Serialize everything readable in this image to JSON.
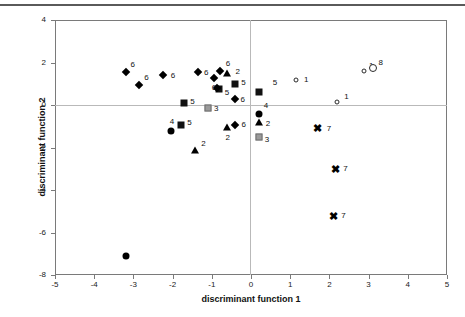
{
  "chart_data": {
    "type": "scatter",
    "title": "",
    "xlabel": "discriminant function 1",
    "ylabel": "discriminant function 2",
    "xlim": [
      -5,
      5
    ],
    "ylim": [
      -8,
      4
    ],
    "xticks": [
      "-5",
      "-4",
      "-3",
      "-2",
      "-1",
      "0",
      "1",
      "2",
      "3",
      "4",
      "5"
    ],
    "yticks": [
      "4",
      "2",
      "0",
      "-2",
      "-4",
      "-6",
      "-8"
    ],
    "xtick_values": [
      -5,
      -4,
      -3,
      -2,
      -1,
      0,
      1,
      2,
      3,
      4,
      5
    ],
    "ytick_values": [
      4,
      2,
      0,
      -2,
      -4,
      -6,
      -8
    ],
    "grid": false,
    "zero_lines": true,
    "legend": "none",
    "marker_legend": [
      {
        "group": "1",
        "marker": "open-circle-small"
      },
      {
        "group": "2",
        "marker": "filled-triangle"
      },
      {
        "group": "3",
        "marker": "gray-square"
      },
      {
        "group": "4",
        "marker": "filled-circle"
      },
      {
        "group": "5",
        "marker": "filled-square"
      },
      {
        "group": "6",
        "marker": "filled-diamond"
      },
      {
        "group": "7",
        "marker": "bold-cross"
      },
      {
        "group": "8",
        "marker": "open-circle-large"
      }
    ],
    "points": [
      {
        "x": -3.2,
        "y": 1.55,
        "label": "6",
        "marker": "filled-diamond",
        "lx": 5,
        "ly": -8
      },
      {
        "x": -2.85,
        "y": 0.95,
        "label": "6",
        "marker": "filled-diamond",
        "lx": 5,
        "ly": -8
      },
      {
        "x": -2.25,
        "y": 1.4,
        "label": "6",
        "marker": "filled-diamond",
        "lx": 8,
        "ly": 0
      },
      {
        "x": -1.35,
        "y": 1.55,
        "label": "6",
        "marker": "filled-diamond",
        "lx": 6,
        "ly": 0
      },
      {
        "x": -0.95,
        "y": 1.25,
        "label": "6",
        "marker": "filled-diamond",
        "lx": -2,
        "ly": 9
      },
      {
        "x": -0.8,
        "y": 1.6,
        "label": "6",
        "marker": "filled-diamond",
        "lx": 6,
        "ly": -8
      },
      {
        "x": -0.6,
        "y": 1.5,
        "label": "2",
        "marker": "filled-triangle",
        "lx": 8,
        "ly": -2
      },
      {
        "x": -0.82,
        "y": 0.75,
        "label": "5",
        "marker": "filled-square",
        "lx": 6,
        "ly": 3
      },
      {
        "x": -0.88,
        "y": 0.78,
        "label": "",
        "marker": "filled-diamond",
        "lx": 0,
        "ly": 0
      },
      {
        "x": -0.4,
        "y": 1.0,
        "label": "5",
        "marker": "filled-square",
        "lx": 6,
        "ly": -2
      },
      {
        "x": -0.42,
        "y": 0.3,
        "label": "6",
        "marker": "filled-diamond",
        "lx": 6,
        "ly": 0
      },
      {
        "x": -1.7,
        "y": 0.1,
        "label": "5",
        "marker": "filled-square",
        "lx": 6,
        "ly": -2
      },
      {
        "x": -1.1,
        "y": -0.15,
        "label": "3",
        "marker": "gray-square",
        "lx": 6,
        "ly": 0
      },
      {
        "x": -2.05,
        "y": -1.2,
        "label": "4",
        "marker": "filled-circle",
        "lx": -1,
        "ly": -10
      },
      {
        "x": -1.78,
        "y": -0.95,
        "label": "5",
        "marker": "filled-square",
        "lx": 6,
        "ly": -3
      },
      {
        "x": -1.42,
        "y": -2.12,
        "label": "2",
        "marker": "filled-triangle",
        "lx": 6,
        "ly": -7
      },
      {
        "x": -0.6,
        "y": -1.05,
        "label": "2",
        "marker": "filled-triangle",
        "lx": -2,
        "ly": 10
      },
      {
        "x": -0.42,
        "y": -0.95,
        "label": "6",
        "marker": "filled-diamond",
        "lx": 7,
        "ly": -1
      },
      {
        "x": 0.2,
        "y": 0.6,
        "label": "5",
        "marker": "filled-square",
        "lx": 14,
        "ly": -10
      },
      {
        "x": 0.2,
        "y": -0.4,
        "label": "4",
        "marker": "filled-circle",
        "lx": 5,
        "ly": -9
      },
      {
        "x": 0.2,
        "y": -0.8,
        "label": "2",
        "marker": "filled-triangle",
        "lx": 7,
        "ly": 1
      },
      {
        "x": 0.2,
        "y": -1.5,
        "label": "3",
        "marker": "gray-square",
        "lx": 6,
        "ly": 2
      },
      {
        "x": 1.15,
        "y": 1.2,
        "label": "1",
        "marker": "open-circle-small",
        "lx": 8,
        "ly": -1
      },
      {
        "x": 2.2,
        "y": 0.15,
        "label": "1",
        "marker": "open-circle-small",
        "lx": 7,
        "ly": -6
      },
      {
        "x": 2.88,
        "y": 1.6,
        "label": "1",
        "marker": "open-circle-small",
        "lx": 5,
        "ly": -6
      },
      {
        "x": 3.1,
        "y": 1.75,
        "label": "8",
        "marker": "open-circle-large",
        "lx": 6,
        "ly": -6
      },
      {
        "x": 1.7,
        "y": -1.1,
        "label": "7",
        "marker": "bold-cross",
        "lx": 9,
        "ly": 0
      },
      {
        "x": 2.15,
        "y": -3.0,
        "label": "7",
        "marker": "bold-cross",
        "lx": 8,
        "ly": -1
      },
      {
        "x": 2.1,
        "y": -5.2,
        "label": "7",
        "marker": "bold-cross",
        "lx": 8,
        "ly": -1
      },
      {
        "x": -3.2,
        "y": -7.1,
        "label": "",
        "marker": "filled-circle",
        "lx": 0,
        "ly": 0
      }
    ]
  },
  "colors": {
    "marker_black": "#000000",
    "marker_gray": "#9a9a9a",
    "frame": "#7a7a7a",
    "zero_line": "#b9b9b9",
    "text": "#111111",
    "background": "#ffffff"
  }
}
